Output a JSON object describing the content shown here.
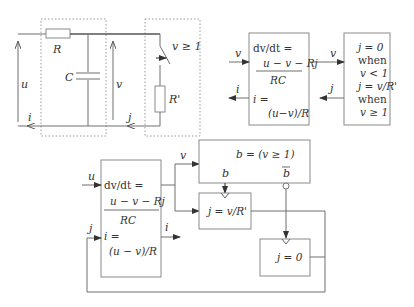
{
  "circuit": {
    "resistor_label": "R",
    "capacitor_label": "C",
    "switch_condition": "v ≥ 1",
    "load_resistor_label": "R'",
    "input_voltage_label": "u",
    "capacitor_voltage_label": "v",
    "input_current_label": "i",
    "load_current_label": "j"
  },
  "top_diagram": {
    "integrator_block": {
      "line1": "dv/dt =",
      "numerator": "u − v − Rj",
      "denominator": "RC",
      "line3": "i =",
      "line4": "(u−v)/R"
    },
    "switch_block": {
      "lines": [
        "j = 0",
        "when",
        "v < 1",
        "j = v/R'",
        "when",
        "v ≥ 1"
      ]
    },
    "input_label": "v",
    "output_label": "i",
    "forward_label": "v",
    "feedback_label": "j"
  },
  "bottom_diagram": {
    "integrator_block": {
      "line1": "dv/dt =",
      "numerator": "u − v − Rj",
      "denominator": "RC",
      "line3": "i =",
      "line4": "(u − v)/R"
    },
    "input_u_label": "u",
    "input_j_label": "j",
    "output_i_label": "i",
    "output_v_label": "v",
    "comparator_block": "b = (v ≥ 1)",
    "b_label": "b",
    "b_bar_label": "b",
    "active_block": "j = v/R'",
    "inactive_block": "j = 0"
  }
}
